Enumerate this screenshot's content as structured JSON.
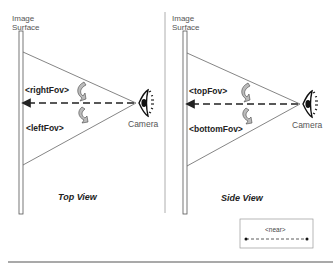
{
  "top_view": {
    "surface_label_line1": "Image",
    "surface_label_line2": "Surface",
    "fov_upper": "<rightFov>",
    "fov_lower": "<leftFov>",
    "camera_label": "Camera",
    "caption": "Top View"
  },
  "side_view": {
    "surface_label_line1": "Image",
    "surface_label_line2": "Surface",
    "fov_upper": "<topFov>",
    "fov_lower": "<bottomFov>",
    "camera_label": "Camera",
    "caption": "Side View"
  },
  "legend": {
    "label": "<near>",
    "icon": "dashed-double-arrow"
  },
  "colors": {
    "line": "#555555",
    "text": "#222222",
    "arrow_fill": "#bbbbbb"
  }
}
